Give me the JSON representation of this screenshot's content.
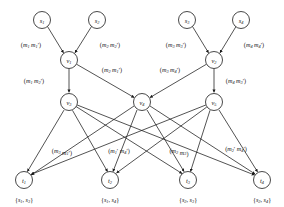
{
  "figure": {
    "stroke_color": "#1a1a1a",
    "background_color": "#ffffff"
  },
  "nodes": {
    "sources": [
      {
        "id": "s1",
        "base": "s",
        "sub": "1",
        "x": 42,
        "y": 20
      },
      {
        "id": "s2",
        "base": "s",
        "sub": "2",
        "x": 97,
        "y": 20
      },
      {
        "id": "s3",
        "base": "s",
        "sub": "3",
        "x": 187,
        "y": 20
      },
      {
        "id": "s4",
        "base": "s",
        "sub": "4",
        "x": 241,
        "y": 20
      }
    ],
    "intermediate_upper": [
      {
        "id": "v1",
        "base": "v",
        "sub": "1",
        "x": 69,
        "y": 60
      },
      {
        "id": "v2",
        "base": "v",
        "sub": "2",
        "x": 214,
        "y": 60
      }
    ],
    "intermediate_lower": [
      {
        "id": "v3",
        "base": "v",
        "sub": "3",
        "x": 69,
        "y": 102
      },
      {
        "id": "v4",
        "base": "v",
        "sub": "4",
        "x": 142,
        "y": 102
      },
      {
        "id": "v5",
        "base": "v",
        "sub": "5",
        "x": 214,
        "y": 102
      }
    ],
    "sinks": [
      {
        "id": "t1",
        "base": "t",
        "sub": "1",
        "x": 24,
        "y": 180
      },
      {
        "id": "t2",
        "base": "t",
        "sub": "2",
        "x": 110,
        "y": 180
      },
      {
        "id": "t3",
        "base": "t",
        "sub": "3",
        "x": 188,
        "y": 180
      },
      {
        "id": "t4",
        "base": "t",
        "sub": "4",
        "x": 262,
        "y": 180
      }
    ],
    "radius": 8.5
  },
  "edge_labels": {
    "row_top": [
      {
        "id": "lbl-s1-v1",
        "text": "(m1 m1')",
        "m1": "m",
        "m1sub": "1",
        "m2": "m",
        "m2sub": "1",
        "prime2": "′",
        "x": 31,
        "y": 44
      },
      {
        "id": "lbl-s2-v1",
        "text": "(m2 m2')",
        "m1": "m",
        "m1sub": "2",
        "m2": "m",
        "m2sub": "2",
        "prime2": "′",
        "x": 110,
        "y": 44
      },
      {
        "id": "lbl-s3-v2",
        "text": "(m3 m3')",
        "m1": "m",
        "m1sub": "3",
        "m2": "m",
        "m2sub": "3",
        "prime2": "′",
        "x": 176,
        "y": 44
      },
      {
        "id": "lbl-s4-v2",
        "text": "(m4 m4')",
        "m1": "m",
        "m1sub": "4",
        "m2": "m",
        "m2sub": "4",
        "prime2": "′",
        "x": 254,
        "y": 44
      }
    ],
    "row_mid": [
      {
        "id": "lbl-v1-v3",
        "text": "(m1 m2')",
        "m1": "m",
        "m1sub": "1",
        "m2": "m",
        "m2sub": "2",
        "prime2": "′",
        "x": 34,
        "y": 80
      },
      {
        "id": "lbl-v1-v4",
        "text": "(m2 m1')",
        "m1": "m",
        "m1sub": "2",
        "m2": "m",
        "m2sub": "1",
        "prime2": "′",
        "x": 112,
        "y": 69
      },
      {
        "id": "lbl-v2-v4",
        "text": "(m3 m4')",
        "m1": "m",
        "m1sub": "3",
        "m2": "m",
        "m2sub": "4",
        "prime2": "′",
        "x": 170,
        "y": 69
      },
      {
        "id": "lbl-v2-v5",
        "text": "(m4 m3')",
        "m1": "m",
        "m1sub": "4",
        "m2": "m",
        "m2sub": "3",
        "prime2": "′",
        "x": 236,
        "y": 80
      }
    ],
    "row_bottom": [
      {
        "id": "lbl-b1",
        "text": "(m3 m1')",
        "m1": "m",
        "m1sub": "3",
        "prime1": "",
        "m2": "m",
        "m2sub": "1",
        "prime2": "′",
        "x": 62,
        "y": 150
      },
      {
        "id": "lbl-b2",
        "text": "(m1' m4')",
        "m1": "m",
        "m1sub": "1",
        "prime1": "′",
        "m2": "m",
        "m2sub": "4",
        "prime2": "′",
        "x": 119,
        "y": 150
      },
      {
        "id": "lbl-b3",
        "text": "(m2 m3)",
        "m1": "m",
        "m1sub": "2",
        "prime1": "",
        "m2": "m",
        "m2sub": "3",
        "prime2": "",
        "x": 179,
        "y": 150
      },
      {
        "id": "lbl-b4",
        "text": "(m2' m4')",
        "m1": "m",
        "m1sub": "2",
        "prime1": "′",
        "m2": "m",
        "m2sub": "4",
        "prime2": "′",
        "x": 236,
        "y": 148
      }
    ]
  },
  "sink_sets": [
    {
      "id": "set-t1",
      "text": "{s1, s3}",
      "a": "s",
      "asub": "1",
      "b": "s",
      "bsub": "3",
      "x": 24,
      "y": 199
    },
    {
      "id": "set-t2",
      "text": "{s1, s4}",
      "a": "s",
      "asub": "1",
      "b": "s",
      "bsub": "4",
      "x": 110,
      "y": 199
    },
    {
      "id": "set-t3",
      "text": "{s2, s3}",
      "a": "s",
      "asub": "2",
      "b": "s",
      "bsub": "3",
      "x": 188,
      "y": 199
    },
    {
      "id": "set-t4",
      "text": "{s2, s4}",
      "a": "s",
      "asub": "2",
      "b": "s",
      "bsub": "4",
      "x": 262,
      "y": 199
    }
  ],
  "edges": {
    "sources_to_v": [
      {
        "from": "s1",
        "to": "v1"
      },
      {
        "from": "s2",
        "to": "v1"
      },
      {
        "from": "s3",
        "to": "v2"
      },
      {
        "from": "s4",
        "to": "v2"
      }
    ],
    "v_to_v": [
      {
        "from": "v1",
        "to": "v3"
      },
      {
        "from": "v1",
        "to": "v4"
      },
      {
        "from": "v2",
        "to": "v4"
      },
      {
        "from": "v2",
        "to": "v5"
      }
    ],
    "v_to_sinks": [
      {
        "from": "v3",
        "to": "t1"
      },
      {
        "from": "v3",
        "to": "t2"
      },
      {
        "from": "v3",
        "to": "t3"
      },
      {
        "from": "v3",
        "to": "t4"
      },
      {
        "from": "v4",
        "to": "t1"
      },
      {
        "from": "v4",
        "to": "t2"
      },
      {
        "from": "v4",
        "to": "t3"
      },
      {
        "from": "v4",
        "to": "t4"
      },
      {
        "from": "v5",
        "to": "t1"
      },
      {
        "from": "v5",
        "to": "t2"
      },
      {
        "from": "v5",
        "to": "t3"
      },
      {
        "from": "v5",
        "to": "t4"
      }
    ]
  }
}
